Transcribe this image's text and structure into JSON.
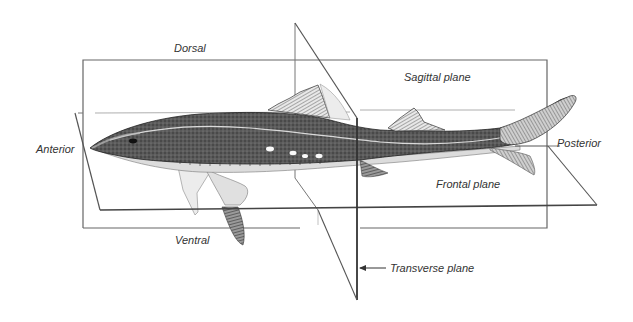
{
  "figure": {
    "labels": {
      "dorsal": "Dorsal",
      "ventral": "Ventral",
      "anterior": "Anterior",
      "posterior": "Posterior",
      "sagittal_plane": "Sagittal plane",
      "frontal_plane": "Frontal plane",
      "transverse_plane": "Transverse plane"
    },
    "colors": {
      "line": "#555555",
      "shark_dark": "#2e2e2e",
      "shark_mid": "#6a6a6a",
      "shark_light": "#d8d8d8",
      "text": "#333333"
    }
  }
}
